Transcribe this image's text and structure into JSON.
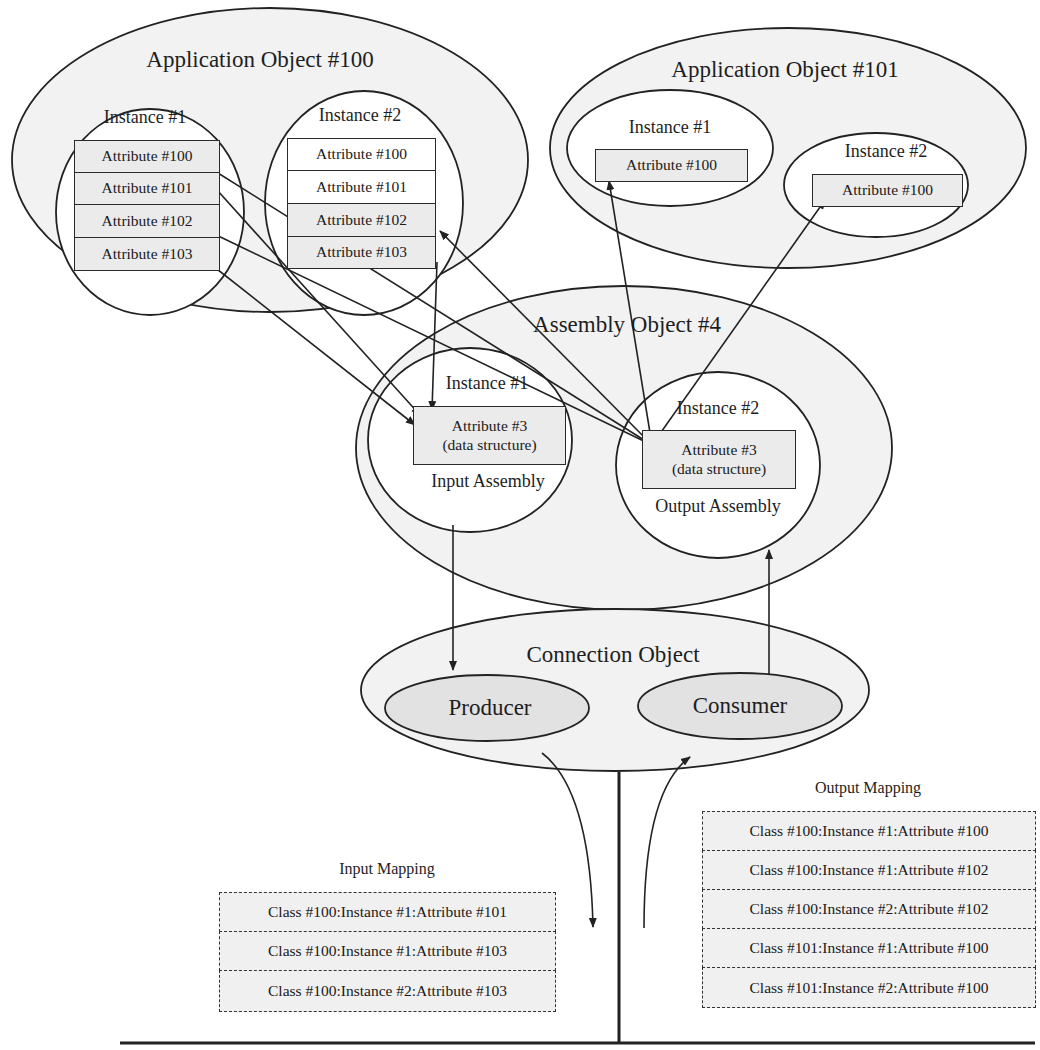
{
  "app_object_100": {
    "title": "Application Object #100",
    "instance_1": {
      "title": "Instance #1",
      "attributes": [
        "Attribute #100",
        "Attribute #101",
        "Attribute #102",
        "Attribute #103"
      ]
    },
    "instance_2": {
      "title": "Instance #2",
      "attributes": [
        "Attribute #100",
        "Attribute #101",
        "Attribute #102",
        "Attribute #103"
      ]
    }
  },
  "app_object_101": {
    "title": "Application Object #101",
    "instance_1": {
      "title": "Instance #1",
      "attribute": "Attribute #100"
    },
    "instance_2": {
      "title": "Instance #2",
      "attribute": "Attribute #100"
    }
  },
  "assembly_object": {
    "title": "Assembly Object #4",
    "instance_1": {
      "title": "Instance #1",
      "attr_line1": "Attribute #3",
      "attr_line2": "(data structure)",
      "caption": "Input Assembly"
    },
    "instance_2": {
      "title": "Instance #2",
      "attr_line1": "Attribute #3",
      "attr_line2": "(data structure)",
      "caption": "Output Assembly"
    }
  },
  "connection_object": {
    "title": "Connection Object",
    "producer": "Producer",
    "consumer": "Consumer"
  },
  "input_mapping": {
    "title": "Input Mapping",
    "rows": [
      "Class #100:Instance #1:Attribute #101",
      "Class #100:Instance #1:Attribute #103",
      "Class #100:Instance #2:Attribute #103"
    ]
  },
  "output_mapping": {
    "title": "Output Mapping",
    "rows": [
      "Class #100:Instance #1:Attribute #100",
      "Class #100:Instance #1:Attribute #102",
      "Class #100:Instance #2:Attribute #102",
      "Class #101:Instance #1:Attribute #100",
      "Class #101:Instance #2:Attribute #100"
    ]
  },
  "colors": {
    "stroke": "#222222",
    "ellipse_fill": "#f2f2f2",
    "inner_fill": "#ffffff",
    "attribute_fill": "#ebebeb"
  }
}
